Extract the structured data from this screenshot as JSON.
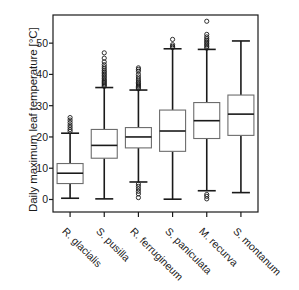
{
  "chart_data": {
    "type": "box",
    "title": "",
    "xlabel": "",
    "ylabel": "Daily maximum leaf temperature [°C]",
    "ylim": [
      -4,
      59
    ],
    "yticks": [
      0,
      10,
      20,
      30,
      40,
      50
    ],
    "ytick_labels": [
      "0",
      "10",
      "20",
      "30",
      "40",
      "50"
    ],
    "grid": false,
    "legend": null,
    "categories": [
      "R. glacialis",
      "S. pusilla",
      "R. ferrugineum",
      "S. paniculata",
      "M. recurva",
      "S. montanum"
    ],
    "boxes": [
      {
        "name": "R. glacialis",
        "whisker_low": 0.4,
        "q1": 5.1,
        "median": 8.4,
        "q3": 11.5,
        "whisker_high": 21.2,
        "outliers": [
          21.8,
          22.4,
          23.1,
          23.8,
          24.6,
          25.4,
          26.2
        ]
      },
      {
        "name": "S. pusilla",
        "whisker_low": 0.2,
        "q1": 13.2,
        "median": 17.3,
        "q3": 22.4,
        "whisker_high": 35.8,
        "outliers": [
          36.2,
          36.6,
          37.0,
          37.4,
          37.8,
          38.2,
          38.7,
          39.2,
          39.7,
          40.2,
          40.7,
          41.2,
          41.8,
          42.4,
          43.1,
          44.0,
          45.2,
          46.9
        ]
      },
      {
        "name": "R. ferrugineum",
        "whisker_low": 5.6,
        "q1": 16.5,
        "median": 20.0,
        "q3": 23.0,
        "whisker_high": 35.0,
        "outliers": [
          0.6,
          1.8,
          2.6,
          3.4,
          4.2,
          4.9,
          35.4,
          35.8,
          36.2,
          36.6,
          37.0,
          37.4,
          37.9,
          38.5,
          39.2,
          40.0,
          41.0,
          41.6,
          42.1
        ]
      },
      {
        "name": "S. paniculata",
        "whisker_low": 0.1,
        "q1": 15.4,
        "median": 21.9,
        "q3": 28.6,
        "whisker_high": 48.2,
        "outliers": [
          48.6,
          49.0,
          49.5,
          51.2
        ]
      },
      {
        "name": "M. recurva",
        "whisker_low": 2.8,
        "q1": 19.5,
        "median": 25.2,
        "q3": 31.0,
        "whisker_high": 48.0,
        "outliers": [
          0.2,
          1.0,
          1.6,
          48.4,
          48.9,
          49.4,
          49.9,
          50.4,
          50.9,
          51.4,
          52.0,
          52.8,
          57.0
        ]
      },
      {
        "name": "S. montanum",
        "whisker_low": 2.2,
        "q1": 20.5,
        "median": 27.3,
        "q3": 33.4,
        "whisker_high": 50.7,
        "outliers": []
      }
    ],
    "colors": {
      "box_edge": "#6d6d6d",
      "median": "#1a1a1a",
      "whisker": "#1a1a1a",
      "outlier": "#1a1a1a",
      "axis": "#1a1a1a",
      "background": "#ffffff"
    }
  },
  "axis_title": "Daily maximum leaf temperature [°C]"
}
